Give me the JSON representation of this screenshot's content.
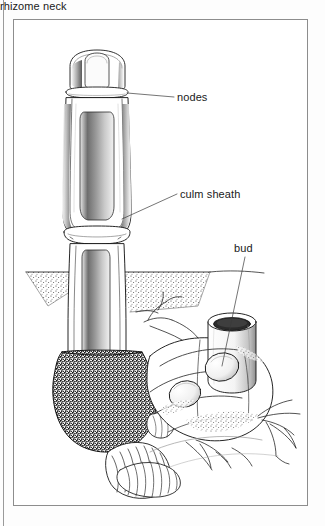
{
  "figure": {
    "medium": "pen-and-ink stipple botanical illustration",
    "background_color": "#ffffff",
    "ink_color": "#1a1a1a",
    "frame_color": "#8d8d8d"
  },
  "labels": [
    {
      "id": "nodes",
      "text": "nodes",
      "leader": true
    },
    {
      "id": "culm_sheath",
      "text": "culm sheath",
      "leader": true
    },
    {
      "id": "bud",
      "text": "bud",
      "leader": true
    },
    {
      "id": "rhizome_neck",
      "text": "rhizome neck",
      "leader": false
    }
  ],
  "parts": {
    "culm": "upright bamboo shoot with overlapping culm sheaths",
    "ground_line": "stippled soil surface cutaway",
    "rhizome_mass": "dark stippled rhizome base",
    "rhizome_neck": "narrow ringed neck joining rhizome to culm",
    "bud_cluster": "lateral buds on rhizome segments",
    "roots": "fine fibrous roots radiating from rhizome"
  }
}
